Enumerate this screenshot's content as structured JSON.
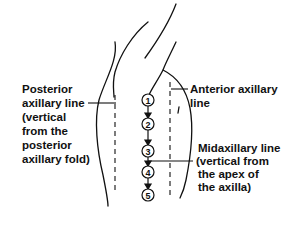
{
  "diagram": {
    "type": "anatomical line drawing",
    "labels": {
      "posterior": [
        "Posterior",
        "axillary line",
        "(vertical",
        "from the",
        "posterior",
        "axillary fold)"
      ],
      "anterior": [
        "Anterior axillary",
        "line"
      ],
      "midaxillary": [
        "Midaxillary line",
        "(vertical from",
        "the apex of",
        "the axilla)"
      ]
    },
    "points": [
      {
        "label": "1",
        "x": 148,
        "y": 100
      },
      {
        "label": "2",
        "x": 148,
        "y": 124
      },
      {
        "label": "3",
        "x": 148,
        "y": 151
      },
      {
        "label": "4",
        "x": 148,
        "y": 172
      },
      {
        "label": "5",
        "x": 148,
        "y": 195
      }
    ],
    "colors": {
      "ink": "#111111",
      "background": "#ffffff"
    }
  }
}
